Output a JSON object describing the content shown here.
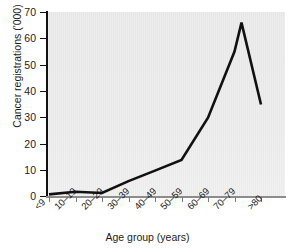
{
  "chart_data": {
    "type": "line",
    "title": "",
    "xlabel": "Age group (years)",
    "ylabel": "Cancer registrations ('000)",
    "categories": [
      "<9",
      "10–19",
      "20–29",
      "30–39",
      "40–49",
      "50–59",
      "60–69",
      "70–79",
      ">80"
    ],
    "values": [
      1,
      2,
      1.5,
      6,
      10,
      14,
      30,
      55,
      66
    ],
    "extra_point": {
      "label": ">80 end",
      "value": 35
    },
    "series": [
      {
        "name": "Cancer registrations",
        "points": [
          {
            "x": "<9",
            "y": 1
          },
          {
            "x": "10–19",
            "y": 2
          },
          {
            "x": "20–29",
            "y": 1.5
          },
          {
            "x": "30–39",
            "y": 6
          },
          {
            "x": "40–49",
            "y": 10
          },
          {
            "x": "50–59",
            "y": 14
          },
          {
            "x": "60–69",
            "y": 30
          },
          {
            "x": "70–79",
            "y": 55
          },
          {
            "x": "peak",
            "y": 66
          },
          {
            "x": ">80",
            "y": 35
          }
        ]
      }
    ],
    "ylim": [
      0,
      70
    ],
    "yticks": [
      0,
      10,
      20,
      30,
      40,
      50,
      60,
      70
    ],
    "grid": false,
    "legend": false,
    "line_color": "#111111",
    "plot_background": "#efefef"
  },
  "axes": {
    "y_labels": [
      "70",
      "60",
      "50",
      "40",
      "30",
      "20",
      "10",
      "0"
    ],
    "y_title": "Cancer registrations ('000)",
    "x_labels": [
      "<9",
      "10–19",
      "20–29",
      "30–39",
      "40–49",
      "50–59",
      "60–69",
      "70–79",
      ">80"
    ],
    "x_title": "Age group (years)"
  }
}
